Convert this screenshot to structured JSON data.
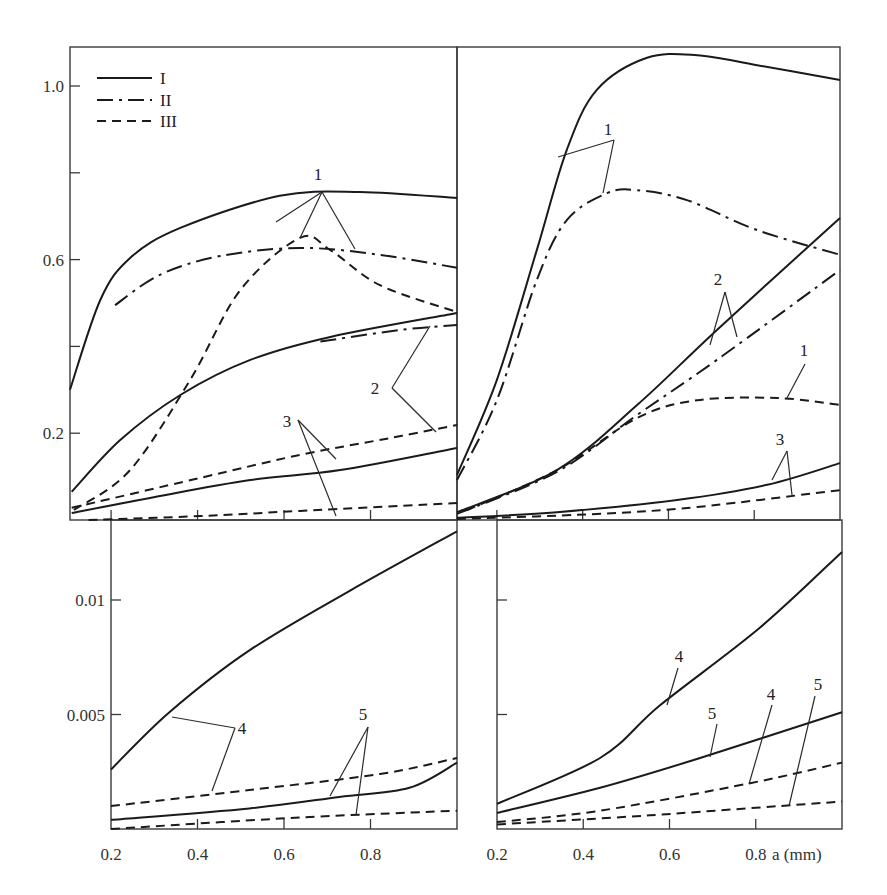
{
  "chart_data": {
    "type": "line",
    "xlabel": "a (mm)",
    "legend": {
      "position": "top-left of top-left panel",
      "entries": [
        {
          "label": "I",
          "style": "solid"
        },
        {
          "label": "II",
          "style": "dash-dot"
        },
        {
          "label": "III",
          "style": "dashed"
        }
      ]
    },
    "panels": [
      {
        "id": "top-left",
        "xlim": [
          0.105,
          1.0
        ],
        "ylim": [
          0,
          1.1
        ],
        "ytick_labels": [
          {
            "v": 1.0,
            "t": "1.0"
          },
          {
            "v": 0.6,
            "t": "0.6"
          },
          {
            "v": 0.2,
            "t": "0.2"
          }
        ],
        "yticks_minor": [
          0.8,
          0.4
        ],
        "xticks": [
          0.2,
          0.4,
          0.6,
          0.8
        ],
        "series": [
          {
            "curve": "1",
            "style": "I",
            "x": [
              0.105,
              0.175,
              0.244,
              0.36,
              0.59,
              0.776,
              1.0
            ],
            "y": [
              0.3,
              0.507,
              0.604,
              0.673,
              0.747,
              0.756,
              0.742
            ]
          },
          {
            "curve": "1",
            "style": "II",
            "x": [
              0.209,
              0.313,
              0.452,
              0.637,
              0.822,
              1.0
            ],
            "y": [
              0.495,
              0.565,
              0.608,
              0.627,
              0.611,
              0.581
            ]
          },
          {
            "curve": "1",
            "style": "III",
            "x": [
              0.114,
              0.244,
              0.383,
              0.499,
              0.637,
              0.707,
              0.822,
              1.0
            ],
            "y": [
              0.023,
              0.115,
              0.323,
              0.53,
              0.65,
              0.622,
              0.541,
              0.479
            ]
          },
          {
            "curve": "2",
            "style": "I",
            "x": [
              0.109,
              0.221,
              0.36,
              0.522,
              0.707,
              1.0
            ],
            "y": [
              0.065,
              0.184,
              0.288,
              0.369,
              0.422,
              0.477
            ]
          },
          {
            "curve": "2",
            "style": "II",
            "x": [
              0.684,
              0.869,
              1.0
            ],
            "y": [
              0.411,
              0.438,
              0.449
            ]
          },
          {
            "curve": "2",
            "style": "III",
            "x": [
              0.109,
              0.406,
              0.637,
              0.846,
              1.0
            ],
            "y": [
              0.028,
              0.097,
              0.15,
              0.189,
              0.219
            ]
          },
          {
            "curve": "3",
            "style": "I",
            "x": [
              0.109,
              0.29,
              0.522,
              0.73,
              1.0
            ],
            "y": [
              0.016,
              0.051,
              0.092,
              0.115,
              0.166
            ]
          },
          {
            "curve": "3",
            "style": "III",
            "x": [
              0.148,
              0.406,
              0.637,
              1.0
            ],
            "y": [
              0.0,
              0.009,
              0.021,
              0.039
            ]
          }
        ],
        "annotations": [
          {
            "text": "1",
            "x": 318,
            "y": 180,
            "leaders": [
              [
                [
                  322,
                  192
                ],
                [
                  276,
                  222
                ]
              ],
              [
                [
                  322,
                  192
                ],
                [
                  300,
                  238
                ]
              ],
              [
                [
                  322,
                  192
                ],
                [
                  355,
                  249
                ]
              ]
            ]
          },
          {
            "text": "2",
            "x": 375,
            "y": 394,
            "leaders": [
              [
                [
                  392,
                  388
                ],
                [
                  430,
                  326
                ]
              ],
              [
                [
                  392,
                  388
                ],
                [
                  436,
                  432
                ]
              ]
            ]
          },
          {
            "text": "3",
            "x": 287,
            "y": 427,
            "leaders": [
              [
                [
                  298,
                  420
                ],
                [
                  336,
                  459
                ]
              ],
              [
                [
                  298,
                  420
                ],
                [
                  336,
                  516
                ]
              ]
            ]
          }
        ]
      },
      {
        "id": "top-right",
        "xlim": [
          0.107,
          1.0
        ],
        "ylim": [
          0,
          1.1
        ],
        "xticks": [
          0.2,
          0.4,
          0.6,
          0.8
        ],
        "series": [
          {
            "curve": "1",
            "style": "I",
            "x": [
              0.107,
              0.2,
              0.293,
              0.363,
              0.433,
              0.55,
              0.667,
              0.807,
              1.0
            ],
            "y": [
              0.104,
              0.323,
              0.622,
              0.853,
              0.991,
              1.065,
              1.071,
              1.048,
              1.014
            ]
          },
          {
            "curve": "1",
            "style": "II",
            "x": [
              0.107,
              0.2,
              0.293,
              0.363,
              0.457,
              0.527,
              0.643,
              0.807,
              1.0
            ],
            "y": [
              0.092,
              0.276,
              0.553,
              0.691,
              0.753,
              0.76,
              0.737,
              0.668,
              0.611
            ]
          },
          {
            "curve": "1",
            "style": "III",
            "x": [
              0.13,
              0.34,
              0.527,
              0.667,
              0.853,
              1.0
            ],
            "y": [
              0.023,
              0.115,
              0.235,
              0.276,
              0.281,
              0.265
            ]
          },
          {
            "curve": "2",
            "style": "I",
            "x": [
              0.107,
              0.34,
              0.527,
              0.713,
              1.0
            ],
            "y": [
              0.018,
              0.115,
              0.265,
              0.438,
              0.696
            ]
          },
          {
            "curve": "2",
            "style": "II",
            "x": [
              0.107,
              0.34,
              0.527,
              0.713,
              1.0
            ],
            "y": [
              0.014,
              0.111,
              0.242,
              0.369,
              0.576
            ]
          },
          {
            "curve": "3",
            "style": "I",
            "x": [
              0.107,
              0.34,
              0.62,
              0.83,
              1.0
            ],
            "y": [
              0.005,
              0.018,
              0.046,
              0.081,
              0.131
            ]
          },
          {
            "curve": "3",
            "style": "III",
            "x": [
              0.107,
              0.433,
              0.667,
              1.0
            ],
            "y": [
              0.002,
              0.014,
              0.03,
              0.069
            ]
          }
        ],
        "annotations": [
          {
            "text": "1",
            "x": 608,
            "y": 135,
            "leaders": [
              [
                [
                  614,
                  140
                ],
                [
                  558,
                  157
                ]
              ],
              [
                [
                  614,
                  140
                ],
                [
                  603,
                  193
                ]
              ]
            ]
          },
          {
            "text": "2",
            "x": 718,
            "y": 285,
            "leaders": [
              [
                [
                  725,
                  292
                ],
                [
                  710,
                  345
                ]
              ],
              [
                [
                  725,
                  292
                ],
                [
                  737,
                  337
                ]
              ]
            ]
          },
          {
            "text": "1",
            "x": 804,
            "y": 356,
            "leaders": [
              [
                [
                  805,
                  364
                ],
                [
                  787,
                  398
                ]
              ]
            ]
          },
          {
            "text": "3",
            "x": 780,
            "y": 445,
            "leaders": [
              [
                [
                  787,
                  451
                ],
                [
                  772,
                  480
                ]
              ],
              [
                [
                  787,
                  451
                ],
                [
                  792,
                  495
                ]
              ]
            ]
          }
        ]
      },
      {
        "id": "bottom-left",
        "xlim": [
          0.2,
          1.0
        ],
        "ylim": [
          0,
          0.0135
        ],
        "ytick_labels": [
          {
            "v": 0.01,
            "t": "0.01"
          },
          {
            "v": 0.005,
            "t": "0.005"
          }
        ],
        "xticks": [
          0.4,
          0.6,
          0.8
        ],
        "xtick_labels": [
          {
            "v": 0.2,
            "t": "0.2"
          },
          {
            "v": 0.4,
            "t": "0.4"
          },
          {
            "v": 0.6,
            "t": "0.6"
          },
          {
            "v": 0.8,
            "t": "0.8"
          }
        ],
        "series": [
          {
            "curve": "4",
            "style": "I",
            "x": [
              0.2,
              0.335,
              0.52,
              0.752,
              1.0
            ],
            "y": [
              0.0026,
              0.0051,
              0.0078,
              0.0104,
              0.013
            ]
          },
          {
            "curve": "4",
            "style": "III",
            "x": [
              0.2,
              0.52,
              0.822,
              1.0
            ],
            "y": [
              0.001,
              0.0017,
              0.0024,
              0.0031
            ]
          },
          {
            "curve": "5",
            "style": "I",
            "x": [
              0.2,
              0.52,
              0.728,
              0.89,
              1.0
            ],
            "y": [
              0.0004,
              0.0009,
              0.0014,
              0.0018,
              0.0029
            ]
          },
          {
            "curve": "5",
            "style": "III",
            "x": [
              0.2,
              0.636,
              1.0
            ],
            "y": [
              0.0,
              0.0005,
              0.0008
            ]
          }
        ],
        "annotations": [
          {
            "text": "4",
            "x": 242,
            "y": 734,
            "leaders": [
              [
                [
                  235,
                  728
                ],
                [
                  172,
                  717
                ]
              ],
              [
                [
                  235,
                  728
                ],
                [
                  212,
                  791
                ]
              ]
            ]
          },
          {
            "text": "5",
            "x": 363,
            "y": 720,
            "leaders": [
              [
                [
                  368,
                  727
                ],
                [
                  330,
                  796
                ]
              ],
              [
                [
                  368,
                  727
                ],
                [
                  356,
                  815
                ]
              ]
            ]
          }
        ]
      },
      {
        "id": "bottom-right",
        "xlim": [
          0.2,
          1.0
        ],
        "ylim": [
          0,
          0.0135
        ],
        "yticks_minor": [
          0.01,
          0.005
        ],
        "xticks": [
          0.4,
          0.6,
          0.8
        ],
        "xtick_labels": [
          {
            "v": 0.2,
            "t": "0.2"
          },
          {
            "v": 0.4,
            "t": "0.4"
          },
          {
            "v": 0.6,
            "t": "0.6"
          },
          {
            "v": 0.8,
            "t": "0.8"
          }
        ],
        "series": [
          {
            "curve": "4",
            "style": "I",
            "x": [
              0.2,
              0.439,
              0.578,
              0.81,
              1.0
            ],
            "y": [
              0.0011,
              0.0031,
              0.0054,
              0.0088,
              0.0121
            ]
          },
          {
            "curve": "5",
            "style": "I",
            "x": [
              0.2,
              0.439,
              0.671,
              1.0
            ],
            "y": [
              0.0007,
              0.0018,
              0.0031,
              0.0051
            ]
          },
          {
            "curve": "4",
            "style": "III",
            "x": [
              0.2,
              0.439,
              0.787,
              1.0
            ],
            "y": [
              0.0003,
              0.0008,
              0.002,
              0.0029
            ]
          },
          {
            "curve": "5",
            "style": "III",
            "x": [
              0.2,
              0.555,
              1.0
            ],
            "y": [
              0.0002,
              0.0006,
              0.0012
            ]
          }
        ],
        "annotations": [
          {
            "text": "4",
            "x": 679,
            "y": 662,
            "leaders": [
              [
                [
                  678,
                  668
                ],
                [
                  667,
                  705
                ]
              ]
            ]
          },
          {
            "text": "5",
            "x": 712,
            "y": 719,
            "leaders": [
              [
                [
                  717,
                  724
                ],
                [
                  710,
                  757
                ]
              ]
            ]
          },
          {
            "text": "4",
            "x": 771,
            "y": 700,
            "leaders": [
              [
                [
                  772,
                  705
                ],
                [
                  749,
                  784
                ]
              ]
            ]
          },
          {
            "text": "5",
            "x": 818,
            "y": 690,
            "leaders": [
              [
                [
                  815,
                  696
                ],
                [
                  789,
                  806
                ]
              ]
            ]
          }
        ]
      }
    ]
  }
}
